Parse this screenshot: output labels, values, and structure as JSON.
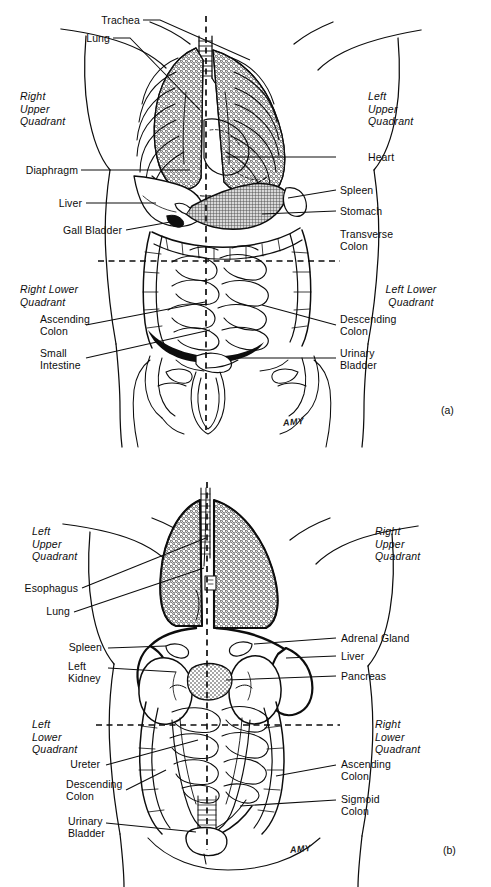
{
  "document": {
    "type": "anatomical-illustration",
    "title": "Abdominal Quadrants",
    "artist_signature": "AMY"
  },
  "figure_a": {
    "tag": "(a)",
    "view": "anterior",
    "signature": "AMY",
    "quadrants": [
      {
        "id": "right-upper",
        "label": "Right\nUpper\nQuadrant"
      },
      {
        "id": "left-upper",
        "label": "Left\nUpper\nQuadrant"
      },
      {
        "id": "right-lower",
        "label": "Right Lower\nQuadrant"
      },
      {
        "id": "left-lower",
        "label": "Left Lower\nQuadrant"
      }
    ],
    "labels_left": [
      {
        "id": "trachea",
        "text": "Trachea"
      },
      {
        "id": "lung",
        "text": "Lung"
      },
      {
        "id": "diaphragm",
        "text": "Diaphragm"
      },
      {
        "id": "liver",
        "text": "Liver"
      },
      {
        "id": "gall-bladder",
        "text": "Gall Bladder"
      },
      {
        "id": "ascending-colon",
        "text": "Ascending\nColon"
      },
      {
        "id": "small-intestine",
        "text": "Small\nIntestine"
      }
    ],
    "labels_right": [
      {
        "id": "heart",
        "text": "Heart"
      },
      {
        "id": "spleen",
        "text": "Spleen"
      },
      {
        "id": "stomach",
        "text": "Stomach"
      },
      {
        "id": "transverse-colon",
        "text": "Transverse\nColon"
      },
      {
        "id": "descending-colon",
        "text": "Descending\nColon"
      },
      {
        "id": "urinary-bladder",
        "text": "Urinary\nBladder"
      }
    ]
  },
  "figure_b": {
    "tag": "(b)",
    "view": "posterior",
    "signature": "AMY",
    "quadrants": [
      {
        "id": "left-upper",
        "label": "Left\nUpper\nQuadrant"
      },
      {
        "id": "right-upper",
        "label": "Right\nUpper\nQuadrant"
      },
      {
        "id": "left-lower",
        "label": "Left\nLower\nQuadrant"
      },
      {
        "id": "right-lower",
        "label": "Right\nLower\nQuadrant"
      }
    ],
    "labels_left": [
      {
        "id": "esophagus",
        "text": "Esophagus"
      },
      {
        "id": "lung",
        "text": "Lung"
      },
      {
        "id": "spleen",
        "text": "Spleen"
      },
      {
        "id": "left-kidney",
        "text": "Left\nKidney"
      },
      {
        "id": "ureter",
        "text": "Ureter"
      },
      {
        "id": "descending-colon",
        "text": "Descending\nColon"
      },
      {
        "id": "urinary-bladder",
        "text": "Urinary\nBladder"
      }
    ],
    "labels_right": [
      {
        "id": "adrenal-gland",
        "text": "Adrenal Gland"
      },
      {
        "id": "liver",
        "text": "Liver"
      },
      {
        "id": "pancreas",
        "text": "Pancreas"
      },
      {
        "id": "ascending-colon",
        "text": "Ascending\nColon"
      },
      {
        "id": "sigmoid-colon",
        "text": "Sigmoid\nColon"
      }
    ]
  },
  "colors": {
    "ink": "#0d0d0d",
    "page": "#ffffff",
    "stomach_fill": "#9a9a9a",
    "organ_fill": "#ffffff"
  }
}
